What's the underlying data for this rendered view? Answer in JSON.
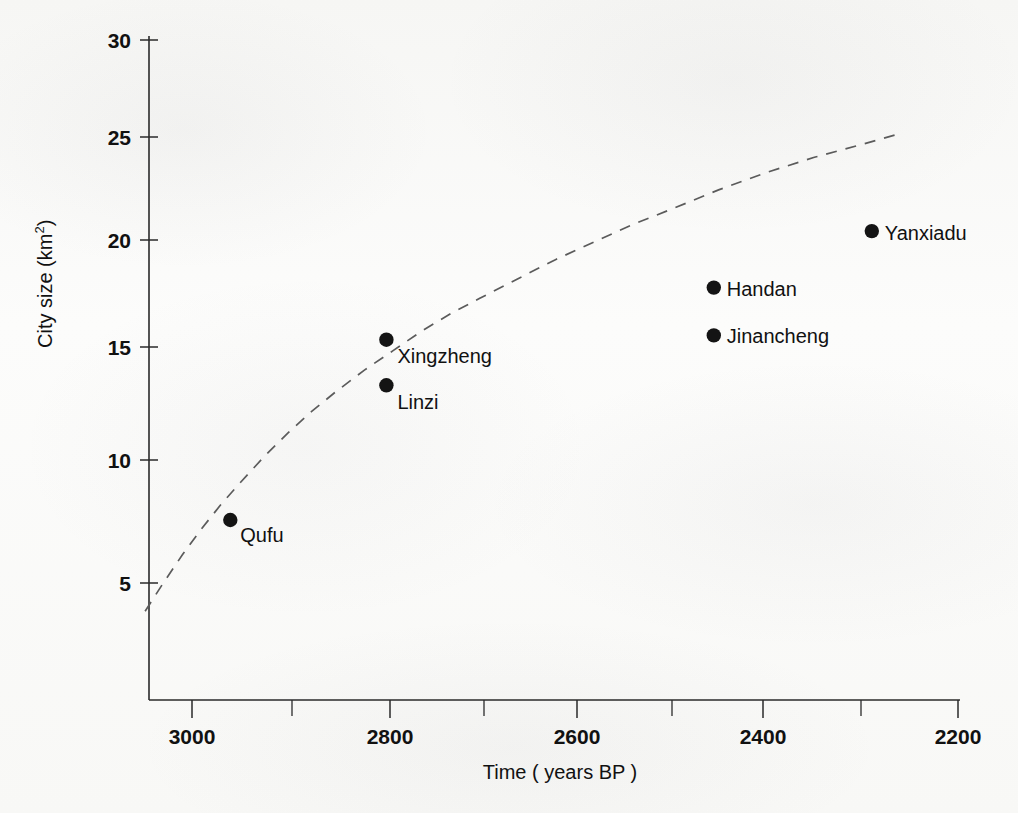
{
  "chart_data": {
    "type": "scatter",
    "title": "",
    "xlabel": "Time ( years BP )",
    "ylabel": "City size (km2)",
    "ylabel_base": "City size (km",
    "ylabel_sup": "2",
    "ylabel_tail": ")",
    "xlim": [
      3050,
      2200
    ],
    "ylim": [
      0,
      30
    ],
    "x_inverted": true,
    "grid": false,
    "legend": "none",
    "xticks": [
      3000,
      2800,
      2600,
      2400,
      2200
    ],
    "xtick_labels": [
      "3000",
      "2800",
      "2600",
      "2400",
      "2200"
    ],
    "xminor_ticks": [
      2900,
      2700,
      2500,
      2300
    ],
    "yticks": [
      5,
      10,
      15,
      20,
      25,
      30
    ],
    "ytick_labels": [
      "5",
      "10",
      "15",
      "20",
      "25",
      "30"
    ],
    "points": [
      {
        "label": "Qufu",
        "x": 2960,
        "y": 7.9,
        "label_dx": 10,
        "label_dy": 22
      },
      {
        "label": "Linzi",
        "x": 2797,
        "y": 14.1,
        "label_dx": 11,
        "label_dy": 24
      },
      {
        "label": "Xingzheng",
        "x": 2797,
        "y": 16.2,
        "label_dx": 11,
        "label_dy": 23
      },
      {
        "label": "Jinancheng",
        "x": 2455,
        "y": 16.4,
        "label_dx": 13,
        "label_dy": 8
      },
      {
        "label": "Handan",
        "x": 2455,
        "y": 18.6,
        "label_dx": 13,
        "label_dy": 8
      },
      {
        "label": "Yanxiadu",
        "x": 2290,
        "y": 21.2,
        "label_dx": 13,
        "label_dy": 9
      }
    ],
    "trend_curve": {
      "style": "dashed",
      "description": "rising saturating dashed trend line",
      "x": [
        3049,
        3030,
        3010,
        2990,
        2970,
        2950,
        2925,
        2900,
        2875,
        2850,
        2820,
        2790,
        2760,
        2730,
        2700,
        2660,
        2620,
        2580,
        2540,
        2500,
        2450,
        2400,
        2350,
        2300,
        2260
      ],
      "y": [
        3.7,
        5.0,
        6.3,
        7.5,
        8.6,
        9.6,
        10.8,
        11.9,
        12.9,
        13.8,
        14.8,
        15.7,
        16.6,
        17.4,
        18.1,
        19.0,
        19.9,
        20.7,
        21.5,
        22.2,
        23.1,
        23.9,
        24.6,
        25.2,
        25.7
      ]
    }
  }
}
